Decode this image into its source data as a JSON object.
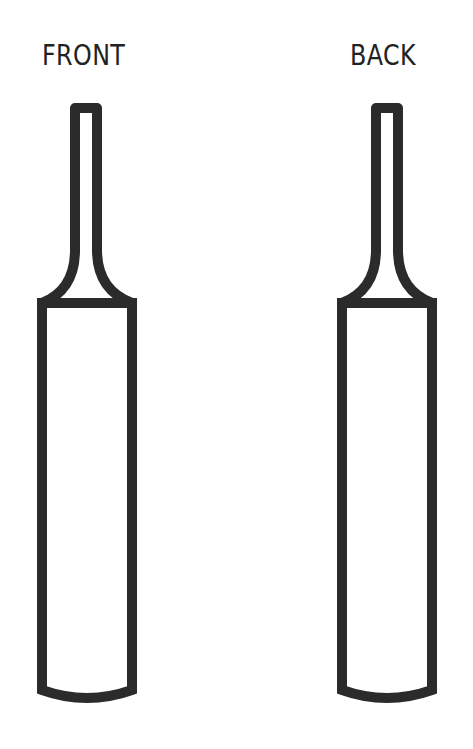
{
  "labels": {
    "front": "FRONT",
    "back": "BACK"
  },
  "colors": {
    "outline": "#2b2b2b",
    "fill": "#ffffff",
    "background": "#ffffff"
  },
  "bats": [
    {
      "side": "front",
      "outline_style": "thick outline",
      "orientation": "vertical, handle up"
    },
    {
      "side": "back",
      "outline_style": "thick outline",
      "orientation": "vertical, handle up"
    }
  ]
}
